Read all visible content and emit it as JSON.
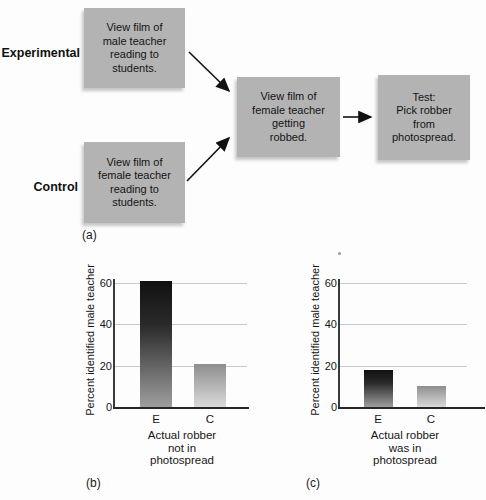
{
  "flowchart": {
    "panel_label": "(a)",
    "row_labels": {
      "experimental": "Experimental",
      "control": "Control"
    },
    "boxes": {
      "experimental_film": "View film of\nmale teacher\nreading to\nstudents.",
      "control_film": "View film of\nfemale teacher\nreading to\nstudents.",
      "robbery_film": "View film of\nfemale teacher\ngetting\nrobbed.",
      "test": "Test:\nPick robber\nfrom\nphotospread."
    }
  },
  "chart_data": [
    {
      "type": "bar",
      "panel_label": "(b)",
      "title": "Actual robber\nnot in\nphotospread",
      "ylabel": "Percent identified male teacher",
      "xlabel": "",
      "categories": [
        "E",
        "C"
      ],
      "values": [
        61,
        21
      ],
      "ylim": [
        0,
        60
      ],
      "yticks": [
        0,
        20,
        40,
        60
      ],
      "grid": "horizontal",
      "legend": "none"
    },
    {
      "type": "bar",
      "panel_label": "(c)",
      "title": "Actual robber\nwas in\nphotospread",
      "ylabel": "Percent identified male teacher",
      "xlabel": "",
      "categories": [
        "E",
        "C"
      ],
      "values": [
        18,
        10
      ],
      "ylim": [
        0,
        60
      ],
      "yticks": [
        0,
        20,
        40,
        60
      ],
      "grid": "horizontal",
      "legend": "none"
    }
  ],
  "colors": {
    "box_fill": "#b3b3b3",
    "bar_e_top": "#111111",
    "bar_e_mid": "#2a2a2a",
    "bar_e_bottom": "#9e9e9e",
    "bar_c_top": "#8e8e8e",
    "bar_c_bottom": "#dadada",
    "gridline": "#c9c9c9",
    "axis": "#3a3a3a",
    "arrow": "#111111"
  }
}
